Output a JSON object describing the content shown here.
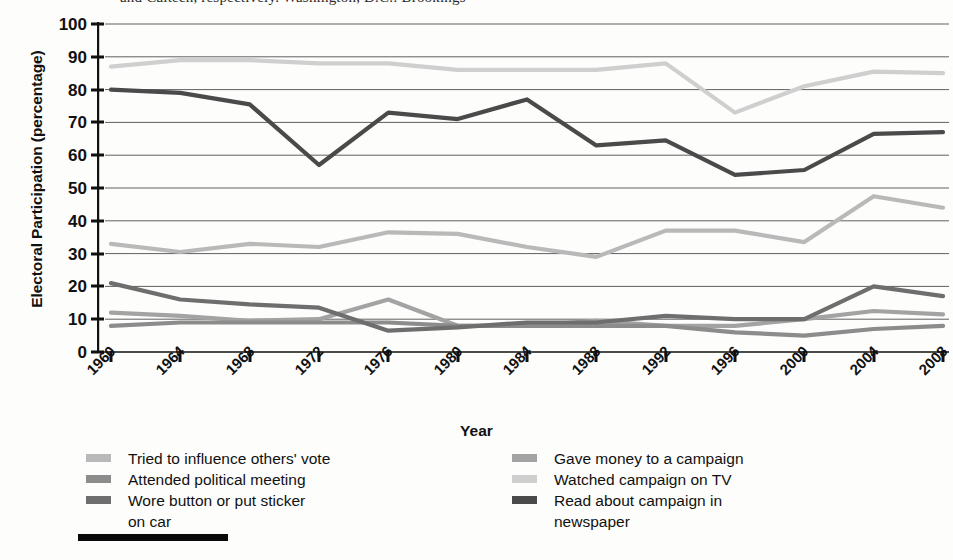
{
  "top_partial_caption": "and Caltech, respectively. Washington, D.C.: Brookings",
  "axis": {
    "y_title": "Electoral Participation (percentage)",
    "x_title": "Year",
    "y_ticks": [
      100,
      90,
      80,
      70,
      60,
      50,
      40,
      30,
      20,
      10,
      0
    ],
    "x_ticks": [
      "1960",
      "1964",
      "1968",
      "1972",
      "1976",
      "1980",
      "1984",
      "1988",
      "1992",
      "1996",
      "2000",
      "2004",
      "2008"
    ]
  },
  "legend": {
    "left": [
      {
        "label": "Tried to influence others' vote",
        "color": "#b9b9b9"
      },
      {
        "label": "Attended political meeting",
        "color": "#8c8c8c"
      },
      {
        "label": "Wore button or put sticker",
        "continuation": "on car",
        "color": "#6e6e6e"
      }
    ],
    "right": [
      {
        "label": "Gave money to a campaign",
        "color": "#a3a3a3"
      },
      {
        "label": "Watched campaign on TV",
        "color": "#cfcfcf"
      },
      {
        "label": "Read about campaign in",
        "continuation": "newspaper",
        "color": "#4a4a4a"
      }
    ]
  },
  "chart_data": {
    "type": "line",
    "title": "",
    "xlabel": "Year",
    "ylabel": "Electoral Participation (percentage)",
    "ylim": [
      0,
      100
    ],
    "ytick_step": 10,
    "grid": "horizontal",
    "legend_position": "below",
    "x": [
      "1960",
      "1964",
      "1968",
      "1972",
      "1976",
      "1980",
      "1984",
      "1988",
      "1992",
      "1996",
      "2000",
      "2004",
      "2008"
    ],
    "series": [
      {
        "name": "Watched campaign on TV",
        "color": "#cfcfcf",
        "values": [
          87,
          89,
          89,
          88,
          88,
          86,
          86,
          86,
          88,
          73,
          81,
          85.5,
          85
        ]
      },
      {
        "name": "Read about campaign in newspaper",
        "color": "#4a4a4a",
        "values": [
          80,
          79,
          75.5,
          57,
          73,
          71,
          77,
          63,
          64.5,
          54,
          55.5,
          66.5,
          67
        ]
      },
      {
        "name": "Tried to influence others' vote",
        "color": "#b9b9b9",
        "values": [
          33,
          30.5,
          33,
          32,
          36.5,
          36,
          32,
          29,
          37,
          37,
          33.5,
          47.5,
          44
        ]
      },
      {
        "name": "Wore button or put sticker on car",
        "color": "#6e6e6e",
        "values": [
          21,
          16,
          14.5,
          13.5,
          6.5,
          7.5,
          9,
          9,
          11,
          10,
          10,
          20,
          17
        ]
      },
      {
        "name": "Gave money to a campaign",
        "color": "#a3a3a3",
        "values": [
          12,
          11,
          9.5,
          10,
          16,
          8,
          8,
          9.5,
          8,
          8,
          10,
          12.5,
          11.5
        ]
      },
      {
        "name": "Attended political meeting",
        "color": "#8c8c8c",
        "values": [
          8,
          9,
          9,
          9,
          9,
          8,
          8,
          8,
          8,
          6,
          5,
          7,
          8
        ]
      }
    ]
  }
}
